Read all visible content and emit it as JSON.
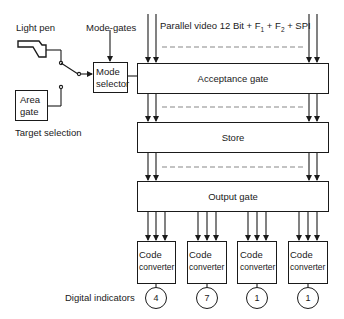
{
  "diagram": {
    "inputs": {
      "light_pen": "Light pen",
      "mode_gates": "Mode-gates",
      "area_gate": [
        "Area",
        "gate"
      ],
      "target_selection": "Target selection",
      "mode_selector": [
        "Mode",
        "selector"
      ]
    },
    "parallel_video": {
      "prefix": "Parallel video  12 Bit + F",
      "sub1": "1",
      "mid": " + F",
      "sub2": "2",
      "suffix": " + SPI"
    },
    "stages": [
      {
        "id": "acceptance",
        "label": "Acceptance gate"
      },
      {
        "id": "store",
        "label": "Store"
      },
      {
        "id": "output",
        "label": "Output gate"
      }
    ],
    "code_converters": [
      {
        "line1": "Code",
        "line2": "converter",
        "indicator": "4"
      },
      {
        "line1": "Code",
        "line2": "converter",
        "indicator": "7"
      },
      {
        "line1": "Code",
        "line2": "converter",
        "indicator": "1"
      },
      {
        "line1": "Code",
        "line2": "converter",
        "indicator": "1"
      }
    ],
    "digital_indicators_label": "Digital indicators"
  }
}
